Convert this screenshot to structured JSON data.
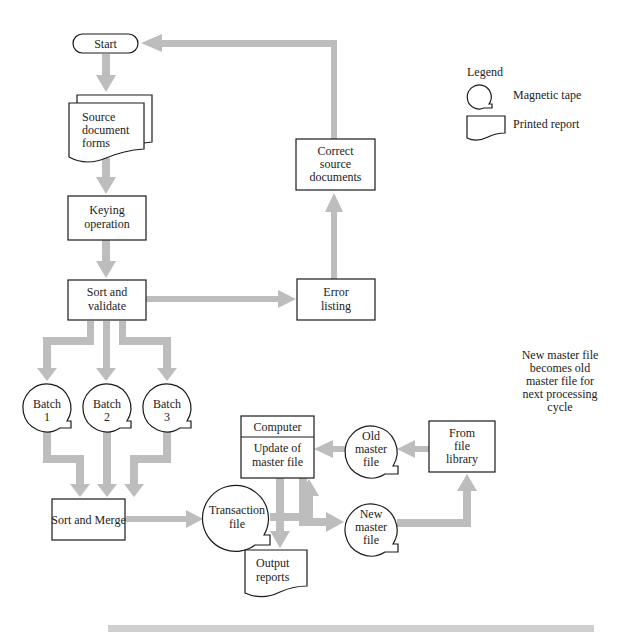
{
  "colors": {
    "arrow": "#bdbdbd",
    "stroke": "#1a1a1a",
    "background": "#ffffff",
    "text": "#222222",
    "bottom_bar": "#cfcfcf"
  },
  "legend": {
    "title": "Legend",
    "items": [
      {
        "icon": "magnetic-tape-icon",
        "label": "Magnetic tape"
      },
      {
        "icon": "printed-report-icon",
        "label": "Printed report"
      }
    ]
  },
  "nodes": {
    "start": {
      "shape": "terminal",
      "lines": [
        "Start"
      ]
    },
    "source_docs": {
      "shape": "multi-document",
      "lines": [
        "Source",
        "document",
        "forms"
      ]
    },
    "keying": {
      "shape": "process",
      "lines": [
        "Keying",
        "operation"
      ]
    },
    "sort_validate": {
      "shape": "process",
      "lines": [
        "Sort and",
        "validate"
      ]
    },
    "error_listing": {
      "shape": "process",
      "lines": [
        "Error",
        "listing"
      ]
    },
    "correct_docs": {
      "shape": "process",
      "lines": [
        "Correct",
        "source",
        "documents"
      ]
    },
    "batch1": {
      "shape": "magnetic-tape",
      "lines": [
        "Batch",
        "1"
      ]
    },
    "batch2": {
      "shape": "magnetic-tape",
      "lines": [
        "Batch",
        "2"
      ]
    },
    "batch3": {
      "shape": "magnetic-tape",
      "lines": [
        "Batch",
        "3"
      ]
    },
    "sort_merge": {
      "shape": "process",
      "lines": [
        "Sort and Merge"
      ]
    },
    "transaction_file": {
      "shape": "magnetic-tape",
      "lines": [
        "Transaction",
        "file"
      ]
    },
    "computer": {
      "shape": "process",
      "header": "Computer",
      "lines": [
        "Update of",
        "master file"
      ]
    },
    "old_master": {
      "shape": "magnetic-tape",
      "lines": [
        "Old",
        "master",
        "file"
      ]
    },
    "new_master": {
      "shape": "magnetic-tape",
      "lines": [
        "New",
        "master",
        "file"
      ]
    },
    "file_library": {
      "shape": "process",
      "lines": [
        "From",
        "file",
        "library"
      ]
    },
    "output_reports": {
      "shape": "document",
      "lines": [
        "Output",
        "reports"
      ]
    }
  },
  "annotation": {
    "lines": [
      "New master file",
      "becomes old",
      "master file for",
      "next processing",
      "cycle"
    ]
  },
  "edges": [
    [
      "start",
      "source_docs"
    ],
    [
      "source_docs",
      "keying"
    ],
    [
      "keying",
      "sort_validate"
    ],
    [
      "sort_validate",
      "error_listing"
    ],
    [
      "error_listing",
      "correct_docs"
    ],
    [
      "correct_docs",
      "start"
    ],
    [
      "sort_validate",
      "batch1"
    ],
    [
      "sort_validate",
      "batch2"
    ],
    [
      "sort_validate",
      "batch3"
    ],
    [
      "batch1",
      "sort_merge"
    ],
    [
      "batch2",
      "sort_merge"
    ],
    [
      "batch3",
      "sort_merge"
    ],
    [
      "sort_merge",
      "transaction_file"
    ],
    [
      "transaction_file",
      "computer"
    ],
    [
      "file_library",
      "old_master"
    ],
    [
      "old_master",
      "computer"
    ],
    [
      "computer",
      "output_reports"
    ],
    [
      "computer",
      "new_master"
    ],
    [
      "new_master",
      "file_library"
    ]
  ]
}
